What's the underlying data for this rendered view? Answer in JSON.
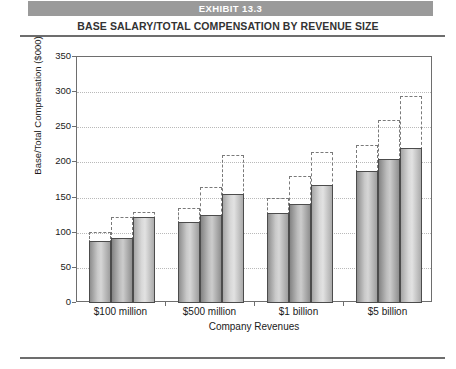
{
  "header": {
    "exhibit_label": "EXHIBIT 13.3",
    "subtitle": "BASE SALARY/TOTAL COMPENSATION BY REVENUE SIZE",
    "header_bar_color": "#9a9a9a"
  },
  "chart_data": {
    "type": "bar",
    "title": "BASE SALARY/TOTAL COMPENSATION BY REVENUE SIZE",
    "subtitle": "EXHIBIT 13.3",
    "xlabel": "Company Revenues",
    "ylabel": "Base/Total Compensation ($000)",
    "categories": [
      "$100 million",
      "$500 million",
      "$1 billion",
      "$5 billion"
    ],
    "ylim": [
      0,
      350
    ],
    "yticks": [
      0,
      50,
      100,
      150,
      200,
      250,
      300,
      350
    ],
    "grid": true,
    "legend_position": "bottom",
    "series": [
      {
        "name": "Top Marketing",
        "color": "#c0c0c0",
        "base_salary": [
          88,
          115,
          128,
          188
        ],
        "total_compensation": [
          101,
          135,
          150,
          225
        ]
      },
      {
        "name": "Top Sales",
        "color": "#b0b0b0",
        "base_salary": [
          92,
          125,
          141,
          205
        ],
        "total_compensation": [
          122,
          165,
          180,
          260
        ]
      },
      {
        "name": "Top Sales and Marketing",
        "color": "#d8d8d8",
        "base_salary": [
          122,
          155,
          168,
          220
        ],
        "total_compensation": [
          130,
          210,
          215,
          295
        ]
      }
    ]
  },
  "legend": {
    "items": [
      {
        "label": "Top Marketing"
      },
      {
        "label": "Top Sales"
      },
      {
        "label": "Top Sales and Marketing"
      }
    ]
  }
}
